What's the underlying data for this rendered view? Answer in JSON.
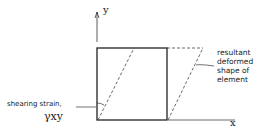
{
  "axes": {
    "x_label": "x",
    "y_label": "y"
  },
  "labels": {
    "shear_line1": "shearing strain,",
    "shear_symbol": "γxy",
    "deformed_line1": "resultant",
    "deformed_line2": "deformed",
    "deformed_line3": "shape of",
    "deformed_line4": "element"
  }
}
